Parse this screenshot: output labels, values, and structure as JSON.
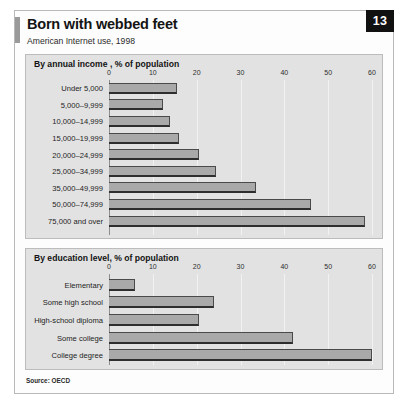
{
  "header": {
    "title": "Born with webbed feet",
    "subtitle": "American Internet use, 1998",
    "page_number": "13"
  },
  "footer": {
    "source": "Source: OECD"
  },
  "chart_data": [
    {
      "type": "bar",
      "orientation": "horizontal",
      "title": "By annual income , % of population",
      "xlabel": "",
      "ylabel": "",
      "xlim": [
        0,
        60
      ],
      "ticks": [
        0,
        10,
        20,
        30,
        40,
        50,
        60
      ],
      "tick_labels": [
        "0",
        "10",
        "20",
        "30",
        "40",
        "50",
        "60"
      ],
      "grid": true,
      "legend": "none",
      "categories": [
        "Under 5,000",
        "5,000–9,999",
        "10,000–14,999",
        "15,000–19,999",
        "20,000–24,999",
        "25,000–34,999",
        "35,000–49,999",
        "50,000–74,999",
        "75,000 and over"
      ],
      "values": [
        15.5,
        12.3,
        14,
        16,
        20.5,
        24.5,
        33.5,
        46,
        58.5
      ]
    },
    {
      "type": "bar",
      "orientation": "horizontal",
      "title": "By education level, % of population",
      "xlabel": "",
      "ylabel": "",
      "xlim": [
        0,
        60
      ],
      "ticks": [
        0,
        10,
        20,
        30,
        40,
        50,
        60
      ],
      "tick_labels": [
        "0",
        "10",
        "20",
        "30",
        "40",
        "50",
        "60"
      ],
      "grid": true,
      "legend": "none",
      "categories": [
        "Elementary",
        "Some high school",
        "High-school diploma",
        "Some college",
        "College degree"
      ],
      "values": [
        6,
        24,
        20.5,
        42,
        60
      ]
    }
  ],
  "colors": {
    "bar_fill": "#a9a9a9",
    "bar_edge": "#2e2e2e",
    "panel_bg": "#e2e2e2",
    "badge_bg": "#111111",
    "badge_text": "#ffffff"
  }
}
